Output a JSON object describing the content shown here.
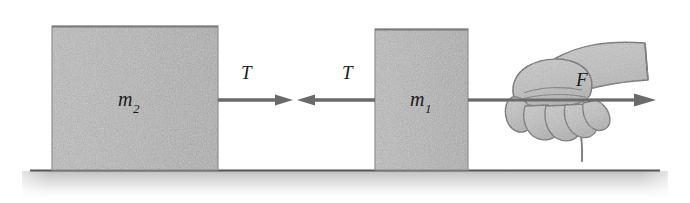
{
  "figure": {
    "background_color": "#ffffff",
    "ink_color": "#5a5a5a",
    "block_fill_color": "#b9b9b9",
    "block_edge_color": "#8a8a8a",
    "ground_line_color": "#555555",
    "label_color": "#1b1b1b"
  },
  "blocks": [
    {
      "id": "block-m2",
      "label_base": "m",
      "label_sub": "2",
      "x": 52,
      "y": 26,
      "width": 166,
      "height": 144
    },
    {
      "id": "block-m1",
      "label_base": "m",
      "label_sub": "1",
      "x": 375,
      "y": 29,
      "width": 93,
      "height": 141
    }
  ],
  "cord": {
    "name": "connecting-cord",
    "y": 100,
    "left_start_x": 218,
    "right_end_x": 655,
    "loose_end_label": "dangling-cord-end"
  },
  "tension_arrows": [
    {
      "id": "tension-arrow-right",
      "label": "T",
      "direction": "right",
      "tail_x": 218,
      "head_x": 293,
      "y": 100,
      "label_x": 247,
      "label_y": 76
    },
    {
      "id": "tension-arrow-left",
      "label": "T",
      "direction": "left",
      "tail_x": 375,
      "head_x": 297,
      "y": 100,
      "label_x": 348,
      "label_y": 76
    }
  ],
  "applied_force": {
    "id": "force-arrow",
    "label": "F",
    "direction": "right",
    "tail_x": 468,
    "head_x": 655,
    "y": 100,
    "label_x": 582,
    "label_y": 80
  },
  "hand": {
    "name": "hand-gripping-cord",
    "description": "fist gripping the cord with forearm sleeve extending up to the right",
    "finger_count": 4,
    "fill_color": "#c2c2c2",
    "outline_color": "#6e6e6e"
  },
  "ground": {
    "name": "ground-surface",
    "line_y": 170,
    "line_start_x": 30,
    "line_end_x": 660,
    "shadow_color": "#cfcfcf"
  }
}
